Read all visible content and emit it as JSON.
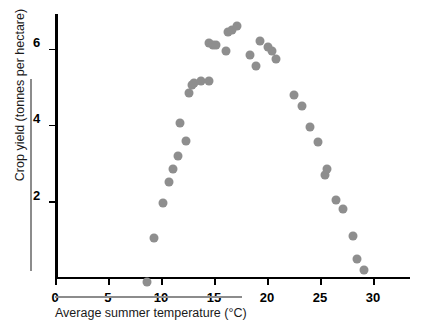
{
  "chart_data": {
    "type": "scatter",
    "title": "",
    "xlabel": "Average summer temperature (°C)",
    "ylabel": "Crop yield (tonnes per hectare)",
    "xlim": [
      0,
      33.5
    ],
    "ylim": [
      0,
      6.95
    ],
    "xticks": [
      0,
      5,
      10,
      15,
      20,
      25,
      30
    ],
    "xtick_labels": [
      "0",
      "5",
      "10",
      "15",
      "20",
      "25",
      "30"
    ],
    "yticks": [
      2,
      4,
      6
    ],
    "ytick_labels": [
      "2",
      "4",
      "6"
    ],
    "grid": false,
    "legend": null,
    "marker_color": "#8e8e8e",
    "axis_color": "#000000",
    "series": [
      {
        "name": "Crop yield vs temperature",
        "points": [
          {
            "x": 8.7,
            "y": 0.05
          },
          {
            "x": 9.3,
            "y": 1.2
          },
          {
            "x": 10.2,
            "y": 2.1
          },
          {
            "x": 10.8,
            "y": 2.65
          },
          {
            "x": 11.1,
            "y": 3.0
          },
          {
            "x": 11.6,
            "y": 3.35
          },
          {
            "x": 11.8,
            "y": 4.2
          },
          {
            "x": 12.4,
            "y": 3.75
          },
          {
            "x": 12.6,
            "y": 5.0
          },
          {
            "x": 12.9,
            "y": 5.2
          },
          {
            "x": 13.1,
            "y": 5.25
          },
          {
            "x": 13.8,
            "y": 5.3
          },
          {
            "x": 14.5,
            "y": 5.3
          },
          {
            "x": 14.5,
            "y": 6.3
          },
          {
            "x": 14.9,
            "y": 6.25
          },
          {
            "x": 15.2,
            "y": 6.25
          },
          {
            "x": 16.1,
            "y": 6.1
          },
          {
            "x": 16.3,
            "y": 6.6
          },
          {
            "x": 16.7,
            "y": 6.65
          },
          {
            "x": 17.2,
            "y": 6.75
          },
          {
            "x": 18.4,
            "y": 6.0
          },
          {
            "x": 19.0,
            "y": 5.7
          },
          {
            "x": 19.3,
            "y": 6.35
          },
          {
            "x": 20.1,
            "y": 6.2
          },
          {
            "x": 20.5,
            "y": 6.1
          },
          {
            "x": 20.9,
            "y": 5.9
          },
          {
            "x": 22.6,
            "y": 4.95
          },
          {
            "x": 23.3,
            "y": 4.65
          },
          {
            "x": 24.1,
            "y": 4.1
          },
          {
            "x": 24.8,
            "y": 3.7
          },
          {
            "x": 25.5,
            "y": 2.85
          },
          {
            "x": 25.7,
            "y": 3.0
          },
          {
            "x": 26.5,
            "y": 2.2
          },
          {
            "x": 27.2,
            "y": 1.95
          },
          {
            "x": 28.1,
            "y": 1.25
          },
          {
            "x": 28.5,
            "y": 0.65
          },
          {
            "x": 29.2,
            "y": 0.35
          }
        ]
      }
    ]
  }
}
